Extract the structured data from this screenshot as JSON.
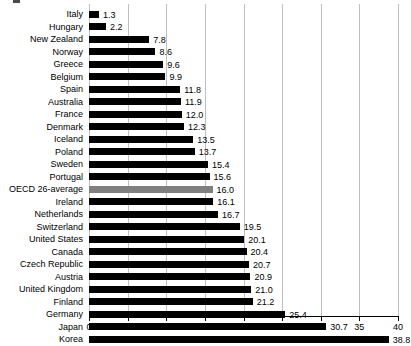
{
  "chart_data": {
    "type": "bar",
    "orientation": "horizontal",
    "title": "",
    "subtitle": "",
    "xlabel": "",
    "ylabel": "",
    "xlim": [
      0,
      40
    ],
    "xticks": [
      "0",
      "5",
      "10",
      "15",
      "20",
      "25",
      "30",
      "35",
      "40"
    ],
    "grid": "vertical",
    "legend": "none",
    "categories": [
      "Italy",
      "Hungary",
      "New Zealand",
      "Norway",
      "Greece",
      "Belgium",
      "Spain",
      "Australia",
      "France",
      "Denmark",
      "Iceland",
      "Poland",
      "Sweden",
      "Portugal",
      "OECD 26-average",
      "Ireland",
      "Netherlands",
      "Switzerland",
      "United States",
      "Canada",
      "Czech Republic",
      "Austria",
      "United Kingdom",
      "Finland",
      "Germany",
      "Japan",
      "Korea"
    ],
    "values": [
      1.3,
      2.2,
      7.8,
      8.6,
      9.6,
      9.9,
      11.8,
      11.9,
      12.0,
      12.3,
      13.5,
      13.7,
      15.4,
      15.6,
      16.0,
      16.1,
      16.7,
      19.5,
      20.1,
      20.4,
      20.7,
      20.9,
      21.0,
      21.2,
      25.4,
      30.7,
      38.8
    ],
    "value_labels": [
      "1.3",
      "2.2",
      "7.8",
      "8.6",
      "9.6",
      "9.9",
      "11.8",
      "11.9",
      "12.0",
      "12.3",
      "13.5",
      "13.7",
      "15.4",
      "15.6",
      "16.0",
      "16.1",
      "16.7",
      "19.5",
      "20.1",
      "20.4",
      "20.7",
      "20.9",
      "21.0",
      "21.2",
      "25.4",
      "30.7",
      "38.8"
    ],
    "highlight_category": "OECD 26-average",
    "colors": {
      "bar": "#000000",
      "highlight_bar": "#808080",
      "gridline": "#bfbfbf",
      "axis": "#000000",
      "background": "#ffffff"
    }
  }
}
